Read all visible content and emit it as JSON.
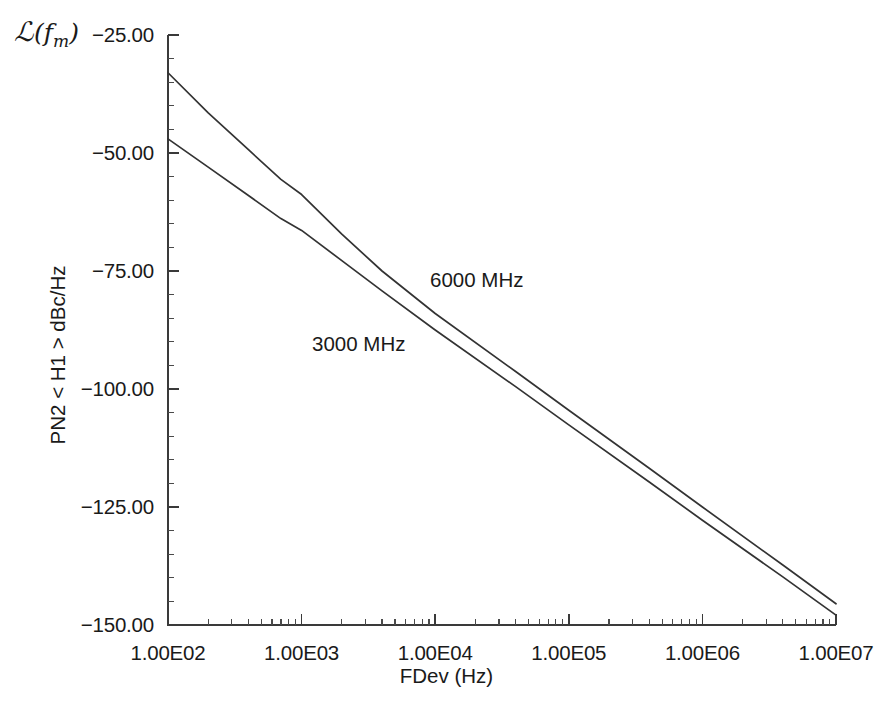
{
  "chart_data": {
    "type": "line",
    "title": "",
    "subtitle": "",
    "corner_symbol": {
      "script_l": "ℒ",
      "open_paren": "(",
      "variable": "f",
      "subscript": "m",
      "close_paren": ")",
      "plain": "L(fm)"
    },
    "xlabel": "FDev (Hz)",
    "ylabel": "PN2 < H1 > dBc/Hz",
    "xscale": "log",
    "yscale": "linear",
    "xlim": [
      100,
      10000000
    ],
    "ylim": [
      -150,
      -25
    ],
    "grid": false,
    "legend_position": "inline-annotation",
    "x_tick_labels": [
      "1.00E02",
      "1.00E03",
      "1.00E04",
      "1.00E05",
      "1.00E06",
      "1.00E07"
    ],
    "x_tick_values": [
      100,
      1000,
      10000,
      100000,
      1000000,
      10000000
    ],
    "y_tick_labels": [
      "-25.00",
      "-50.00",
      "-75.00",
      "-100.00",
      "-125.00",
      "-150.00"
    ],
    "y_tick_values": [
      -25,
      -50,
      -75,
      -100,
      -125,
      -150
    ],
    "x_minor_per_decade": 9,
    "y_minor_per_interval": 5,
    "series": [
      {
        "name": "6000 MHz",
        "label": "6000 MHz",
        "color": "#333333",
        "annotation_x": 430,
        "annotation_y": 268,
        "x": [
          100,
          200,
          400,
          700,
          1000,
          2000,
          4000,
          10000,
          40000,
          100000,
          400000,
          1000000,
          4000000,
          10000000
        ],
        "y": [
          -33.0,
          -41.5,
          -49.3,
          -55.6,
          -58.8,
          -67.2,
          -75.0,
          -84.0,
          -96.3,
          -104.5,
          -116.8,
          -125.0,
          -137.3,
          -145.5
        ]
      },
      {
        "name": "3000 MHz",
        "label": "3000 MHz",
        "color": "#333333",
        "annotation_x": 312,
        "annotation_y": 332,
        "x": [
          100,
          200,
          400,
          700,
          1000,
          2000,
          4000,
          10000,
          40000,
          100000,
          400000,
          1000000,
          4000000,
          10000000
        ],
        "y": [
          -47.0,
          -53.0,
          -59.0,
          -63.9,
          -66.4,
          -72.8,
          -79.2,
          -87.5,
          -99.5,
          -107.6,
          -119.7,
          -127.8,
          -139.8,
          -147.9
        ]
      }
    ]
  },
  "geometry": {
    "plot_left": 168,
    "plot_right": 836,
    "plot_top": 35,
    "plot_bottom": 625
  }
}
